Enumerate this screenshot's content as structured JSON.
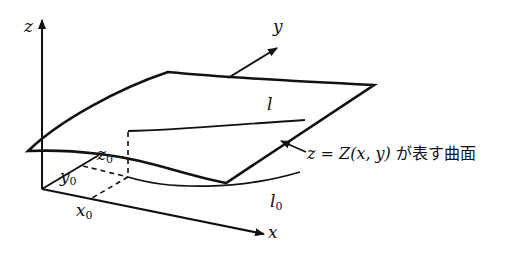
{
  "diagram": {
    "axes": {
      "z": "z",
      "y": "y",
      "x": "x"
    },
    "points": {
      "x0": {
        "base": "x",
        "sub": "0"
      },
      "y0": {
        "base": "y",
        "sub": "0"
      },
      "z0": {
        "base": "z",
        "sub": "0"
      }
    },
    "curves": {
      "l": "l",
      "l0": {
        "base": "l",
        "sub": "0"
      }
    },
    "surface_caption": {
      "lhs": "z",
      "eq": " = ",
      "func": "Z",
      "args": "(x, y)",
      "jp": " が表す曲面"
    },
    "colors": {
      "stroke": "#111111",
      "background": "#ffffff"
    }
  }
}
